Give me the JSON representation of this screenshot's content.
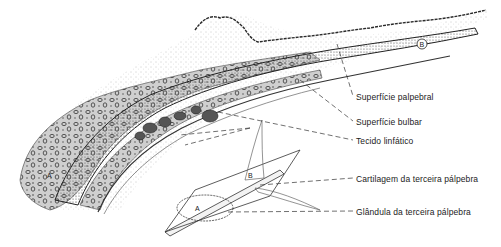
{
  "figure": {
    "colors": {
      "ink": "#2a2a2a",
      "stipple": "#6b6b6b",
      "background": "#ffffff"
    },
    "markers": {
      "cross_section_b": "B",
      "inset_a": "A",
      "inset_b": "B"
    }
  },
  "labels": [
    {
      "id": "palpebral",
      "text": "Superfície palpebral"
    },
    {
      "id": "bulbar",
      "text": "Superfície bulbar"
    },
    {
      "id": "lymphatic",
      "text": "Tecido linfático"
    },
    {
      "id": "cartilage",
      "text": "Cartilagem da terceira pálpebra"
    },
    {
      "id": "gland",
      "text": "Glândula da terceira pálpebra"
    }
  ]
}
